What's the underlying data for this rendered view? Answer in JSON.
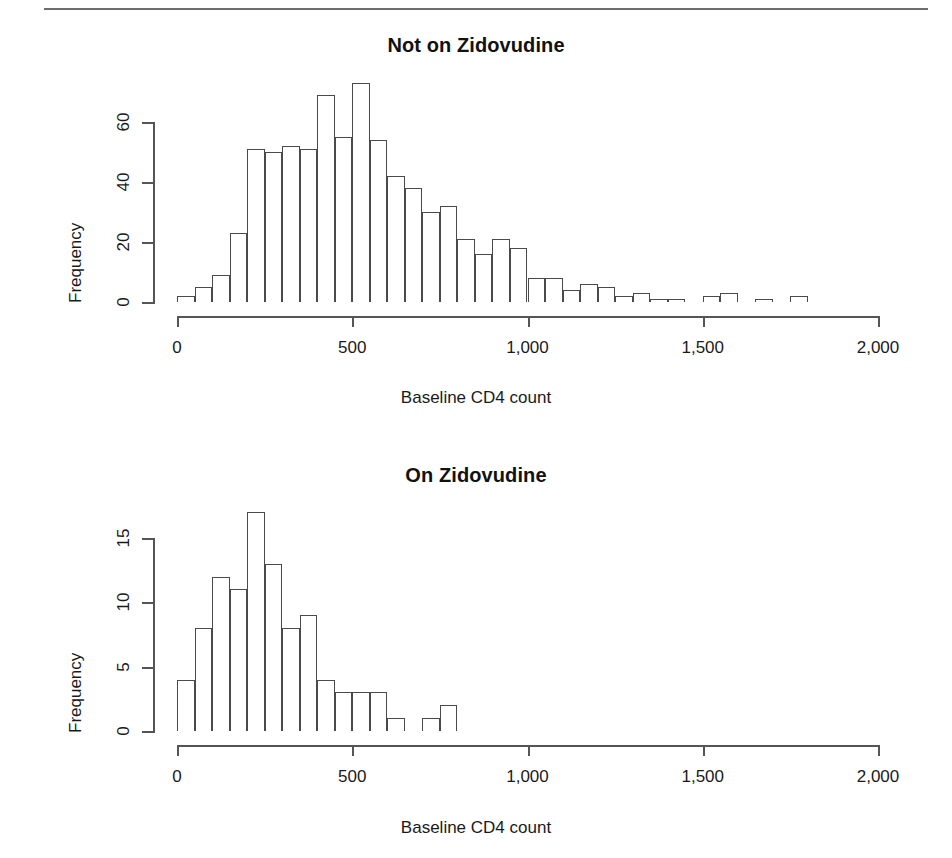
{
  "figure": {
    "background": "#ffffff",
    "axis_color": "#555555",
    "bar_edge_color": "#4a4a4a",
    "bar_fill_color": "#ffffff"
  },
  "panels": [
    {
      "id": "not-on-zidovudine",
      "title": "Not on Zidovudine",
      "xlabel": "Baseline CD4 count",
      "ylabel": "Frequency",
      "x_ticks": [
        0,
        500,
        1000,
        1500,
        2000
      ],
      "x_tick_labels": [
        "0",
        "500",
        "1,000",
        "1,500",
        "2,000"
      ],
      "y_ticks": [
        0,
        20,
        40,
        60
      ],
      "y_tick_labels": [
        "0",
        "20",
        "40",
        "60"
      ]
    },
    {
      "id": "on-zidovudine",
      "title": "On Zidovudine",
      "xlabel": "Baseline CD4 count",
      "ylabel": "Frequency",
      "x_ticks": [
        0,
        500,
        1000,
        1500,
        2000
      ],
      "x_tick_labels": [
        "0",
        "500",
        "1,000",
        "1,500",
        "2,000"
      ],
      "y_ticks": [
        0,
        5,
        10,
        15
      ],
      "y_tick_labels": [
        "0",
        "5",
        "10",
        "15"
      ]
    }
  ],
  "chart_data": [
    {
      "type": "bar",
      "subtype": "histogram",
      "title": "Not on Zidovudine",
      "xlabel": "Baseline CD4 count",
      "ylabel": "Frequency",
      "bin_width": 50,
      "bin_start": 0,
      "bin_edges": [
        0,
        50,
        100,
        150,
        200,
        250,
        300,
        350,
        400,
        450,
        500,
        550,
        600,
        650,
        700,
        750,
        800,
        850,
        900,
        950,
        1000,
        1050,
        1100,
        1150,
        1200,
        1250,
        1300,
        1350,
        1400,
        1450,
        1500,
        1550,
        1600,
        1650,
        1700,
        1750,
        1800
      ],
      "categories": [
        "0-50",
        "50-100",
        "100-150",
        "150-200",
        "200-250",
        "250-300",
        "300-350",
        "350-400",
        "400-450",
        "450-500",
        "500-550",
        "550-600",
        "600-650",
        "650-700",
        "700-750",
        "750-800",
        "800-850",
        "850-900",
        "900-950",
        "950-1000",
        "1000-1050",
        "1050-1100",
        "1100-1150",
        "1150-1200",
        "1200-1250",
        "1250-1300",
        "1300-1350",
        "1350-1400",
        "1400-1450",
        "1450-1500",
        "1500-1550",
        "1550-1600",
        "1600-1650",
        "1650-1700",
        "1700-1750",
        "1750-1800"
      ],
      "values": [
        2,
        5,
        9,
        23,
        51,
        50,
        52,
        51,
        69,
        55,
        73,
        54,
        42,
        38,
        30,
        32,
        21,
        16,
        21,
        18,
        8,
        8,
        4,
        6,
        5,
        2,
        3,
        1,
        1,
        0,
        2,
        3,
        0,
        1,
        0,
        2
      ],
      "xlim": [
        0,
        2000
      ],
      "ylim": [
        0,
        73
      ],
      "y_ticks": [
        0,
        20,
        40,
        60
      ],
      "x_ticks": [
        0,
        500,
        1000,
        1500,
        2000
      ],
      "grid": false,
      "legend": "none"
    },
    {
      "type": "bar",
      "subtype": "histogram",
      "title": "On Zidovudine",
      "xlabel": "Baseline CD4 count",
      "ylabel": "Frequency",
      "bin_width": 50,
      "bin_start": 0,
      "bin_edges": [
        0,
        50,
        100,
        150,
        200,
        250,
        300,
        350,
        400,
        450,
        500,
        550,
        600,
        650,
        700,
        750,
        800
      ],
      "categories": [
        "0-50",
        "50-100",
        "100-150",
        "150-200",
        "200-250",
        "250-300",
        "300-350",
        "350-400",
        "400-450",
        "450-500",
        "500-550",
        "550-600",
        "600-650",
        "650-700",
        "700-750",
        "750-800"
      ],
      "values": [
        4,
        8,
        12,
        11,
        17,
        13,
        8,
        9,
        4,
        3,
        3,
        3,
        1,
        0,
        1,
        2
      ],
      "xlim": [
        0,
        2000
      ],
      "ylim": [
        0,
        17
      ],
      "y_ticks": [
        0,
        5,
        10,
        15
      ],
      "x_ticks": [
        0,
        500,
        1000,
        1500,
        2000
      ],
      "grid": false,
      "legend": "none"
    }
  ]
}
